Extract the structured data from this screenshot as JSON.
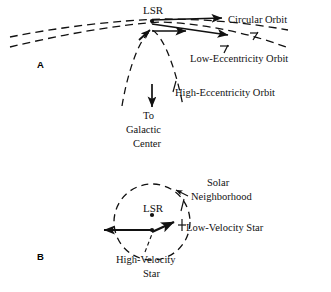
{
  "figure": {
    "background_color": "#ffffff",
    "ink_color": "#111111",
    "width": 331,
    "height": 292
  },
  "panel_a": {
    "letter": "A",
    "lsr_label": "LSR",
    "circular_orbit_label": "Circular Orbit",
    "low_eccentricity_label": "Low-Eccentricity Orbit",
    "high_eccentricity_label": "High-Eccentricity Orbit",
    "direction_line1": "To",
    "direction_line2": "Galactic",
    "direction_line3": "Center"
  },
  "panel_b": {
    "letter": "B",
    "lsr_label": "LSR",
    "solar_line1": "Solar",
    "solar_line2": "Neighborhood",
    "low_velocity_label": "Low-Velocity Star",
    "high_velocity_line1": "High-Velocity",
    "high_velocity_line2": "Star"
  }
}
